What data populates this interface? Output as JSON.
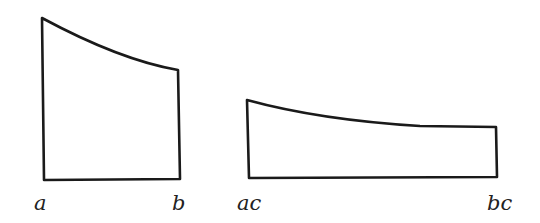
{
  "figure": {
    "left_shape": {
      "label_left": "a",
      "label_right": "b",
      "points": {
        "top_left": [
          42,
          18
        ],
        "top_right": [
          178,
          70
        ],
        "bottom_right": [
          180,
          179
        ],
        "bottom_left": [
          44,
          180
        ]
      },
      "curve_control": [
        120,
        60
      ]
    },
    "right_shape": {
      "label_left": "ac",
      "label_right": "bc",
      "points": {
        "top_left": [
          247,
          100
        ],
        "top_right": [
          496,
          127
        ],
        "bottom_right": [
          497,
          177
        ],
        "bottom_left": [
          249,
          178
        ]
      },
      "curve_control": [
        380,
        127
      ]
    },
    "stroke_color": "#1a1a1a"
  }
}
